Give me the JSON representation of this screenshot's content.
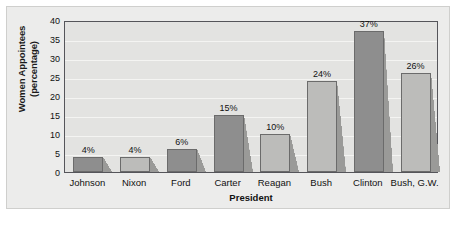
{
  "chart_data": {
    "type": "bar",
    "title": "",
    "xlabel": "President",
    "ylabel": "Women Appointees (percentage)",
    "ylabel_line1": "Women Appointees",
    "ylabel_line2": "(percentage)",
    "categories": [
      "Johnson",
      "Nixon",
      "Ford",
      "Carter",
      "Reagan",
      "Bush",
      "Clinton",
      "Bush, G.W."
    ],
    "values": [
      4,
      4,
      6,
      15,
      10,
      24,
      37,
      26
    ],
    "data_labels": [
      "4%",
      "4%",
      "6%",
      "15%",
      "10%",
      "24%",
      "37%",
      "26%"
    ],
    "bar_shades": [
      "dark",
      "light",
      "dark",
      "dark",
      "light",
      "light",
      "dark",
      "light"
    ],
    "ylim": [
      0,
      40
    ],
    "yticks": [
      0,
      5,
      10,
      15,
      20,
      25,
      30,
      35,
      40
    ],
    "ytick_labels": [
      "0",
      "5",
      "10",
      "15",
      "20",
      "25",
      "30",
      "35",
      "40"
    ],
    "grid": true,
    "legend": "none",
    "units": "percent",
    "colors": {
      "bar_dark": "#8e8e8e",
      "bar_light": "#bcbcba",
      "bar_border": "#6b6b6b",
      "plot_background": "#e3e3e1",
      "figure_background": "#ececeb",
      "gridline": "#f4f4f2",
      "axis": "#55555a",
      "text": "#111111"
    }
  }
}
